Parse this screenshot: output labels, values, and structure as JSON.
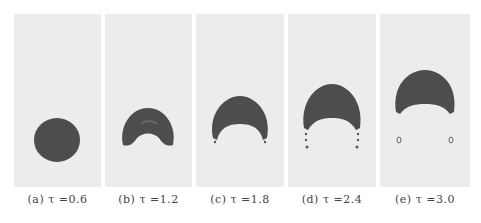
{
  "figure": {
    "panel_background": "#ececec",
    "bubble_color": "#4d4d4d",
    "panels": [
      {
        "id": "a",
        "caption": "(a) τ =0.6"
      },
      {
        "id": "b",
        "caption": "(b) τ =1.2"
      },
      {
        "id": "c",
        "caption": "(c) τ =1.8"
      },
      {
        "id": "d",
        "caption": "(d) τ =2.4"
      },
      {
        "id": "e",
        "caption": "(e) τ =3.0"
      }
    ]
  }
}
